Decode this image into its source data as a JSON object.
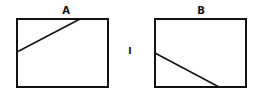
{
  "panels": [
    {
      "label": "A",
      "box": {
        "x": 17,
        "y": 19,
        "w": 91,
        "h": 68
      },
      "line": {
        "x1": 17,
        "y1": 52,
        "x2": 80,
        "y2": 19
      }
    },
    {
      "label": "B",
      "box": {
        "x": 155,
        "y": 19,
        "w": 91,
        "h": 68
      },
      "line": {
        "x1": 155,
        "y1": 53,
        "x2": 219,
        "y2": 87
      }
    }
  ],
  "separator": "I",
  "colors": {
    "stroke": "#111111",
    "background": "#ffffff"
  }
}
